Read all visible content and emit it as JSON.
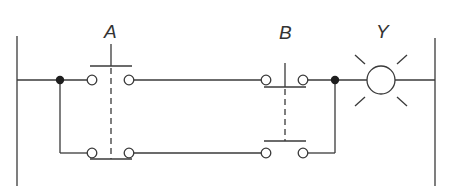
{
  "diagram": {
    "type": "ladder-logic-circuit",
    "labels": {
      "switch_a": "A",
      "switch_b": "B",
      "lamp_y": "Y"
    },
    "components": [
      {
        "id": "A",
        "kind": "double-pole pushbutton (top NO, bottom NC, mechanically linked)"
      },
      {
        "id": "B",
        "kind": "double-pole pushbutton (top NC, bottom NO, mechanically linked)"
      },
      {
        "id": "Y",
        "kind": "lamp / output indicator"
      }
    ],
    "rungs": [
      {
        "position": "top",
        "path": [
          "left-rail",
          "junction-left",
          "A-top",
          "B-top",
          "junction-right",
          "Y",
          "right-rail"
        ]
      },
      {
        "position": "bottom",
        "path": [
          "junction-left",
          "A-bottom",
          "B-bottom",
          "junction-right"
        ]
      }
    ],
    "colors": {
      "line": "#3a3a3a",
      "junction": "#1e1e1e",
      "background": "#ffffff"
    }
  }
}
